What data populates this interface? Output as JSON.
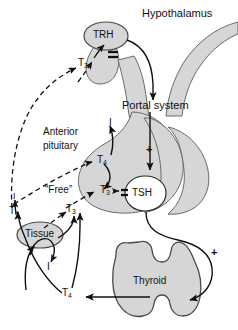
{
  "figure": {
    "background_color": "#ffffff",
    "organ_fill_color": "#d6d6d6",
    "organ_stroke_color": "#4a4a4a",
    "line_color": "#111111",
    "text_color": "#111111"
  },
  "labels": {
    "hypothalamus": "Hypothalamus",
    "trh": "TRH",
    "portal_system": "Portal system",
    "anterior_pituitary_line1": "Anterior",
    "anterior_pituitary_line2": "pituitary",
    "tsh": "TSH",
    "free": "“Free”",
    "tissue": "Tissue",
    "thyroid": "Thyroid"
  },
  "hormones": {
    "t3_hypothalamus": {
      "base": "T",
      "sub": "3"
    },
    "t4_pituitary": {
      "base": "T",
      "sub": "4"
    },
    "t3_pituitary": {
      "base": "T",
      "sub": "3"
    },
    "t4_free": {
      "base": "T",
      "sub": "4"
    },
    "t3_free": {
      "base": "T",
      "sub": "3"
    },
    "t4_thyroid_output": {
      "base": "T",
      "sub": "4"
    }
  },
  "iodine": {
    "i_pituitary": "I",
    "i_tissue_upper": "I",
    "i_tissue_lower": "I"
  },
  "signs": {
    "minus_trh": "–",
    "minus_tsh": "–",
    "plus_portal": "+",
    "plus_thyroid": "+"
  },
  "icon_names": [
    "trh-oval-icon",
    "tsh-circle-icon",
    "tissue-oval-icon",
    "thyroid-gland-icon",
    "pituitary-gland-icon",
    "hypothalamus-vessel-icon",
    "arrow-icon",
    "dashed-arrow-icon"
  ]
}
